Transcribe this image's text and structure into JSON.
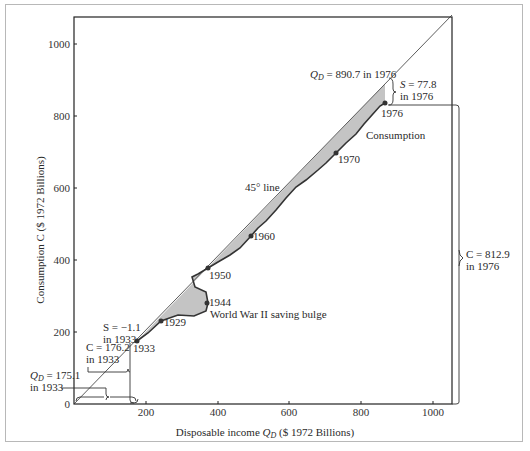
{
  "chart_data": {
    "type": "line",
    "title": "",
    "xlabel": "Disposable income Q_D ($ 1972 Billions)",
    "ylabel": "Consumption C ($ 1972 Billions)",
    "xlim": [
      0,
      1050
    ],
    "ylim": [
      0,
      1080
    ],
    "x_ticks": [
      "200",
      "400",
      "600",
      "800",
      "1000"
    ],
    "y_ticks": [
      "0",
      "200",
      "400",
      "600",
      "800",
      "1000"
    ],
    "grid": false,
    "series": [
      {
        "name": "45° line",
        "points": [
          [
            0,
            0
          ],
          [
            1060,
            1060
          ]
        ]
      },
      {
        "name": "Consumption",
        "points": [
          [
            175.1,
            176.2
          ],
          [
            200,
            190
          ],
          [
            248,
            228
          ],
          [
            290,
            250
          ],
          [
            340,
            270
          ],
          [
            370,
            274
          ],
          [
            385,
            278
          ],
          [
            385,
            320
          ],
          [
            380,
            335
          ],
          [
            360,
            355
          ],
          [
            345,
            362
          ],
          [
            350,
            380
          ],
          [
            372,
            385
          ],
          [
            400,
            400
          ],
          [
            430,
            420
          ],
          [
            460,
            440
          ],
          [
            490,
            460
          ],
          [
            520,
            480
          ],
          [
            550,
            510
          ],
          [
            580,
            530
          ],
          [
            610,
            550
          ],
          [
            640,
            570
          ],
          [
            670,
            600
          ],
          [
            700,
            620
          ],
          [
            740,
            650
          ],
          [
            760,
            680
          ],
          [
            800,
            705
          ],
          [
            840,
            740
          ],
          [
            870,
            790
          ],
          [
            890.7,
            812.9
          ]
        ]
      }
    ],
    "labeled_years": [
      {
        "year": "1929",
        "x": 248,
        "y": 228
      },
      {
        "year": "1933",
        "x": 175.1,
        "y": 176.2
      },
      {
        "year": "1944",
        "x": 370,
        "y": 280
      },
      {
        "year": "1950",
        "x": 373,
        "y": 380
      },
      {
        "year": "1960",
        "x": 494,
        "y": 466
      },
      {
        "year": "1970",
        "x": 730,
        "y": 696
      },
      {
        "year": "1976",
        "x": 890.7,
        "y": 812.9
      }
    ],
    "annotations": [
      "Q_D = 890.7 in 1976",
      "S = 77.8 in 1976",
      "C = 812.9 in 1976",
      "S = −1.1 in 1933",
      "C = 176.2 in 1933",
      "Q_D = 175.1 in 1933",
      "45° line",
      "Consumption",
      "World War II saving bulge"
    ]
  },
  "axes": {
    "x_label_main": "Disposable income ",
    "x_label_var": "Q",
    "x_label_sub": "D",
    "x_label_unit": " ($ 1972 Billions)",
    "y_label": "Consumption C ($ 1972 Billions)",
    "x_ticks": [
      "200",
      "400",
      "600",
      "800",
      "1000"
    ],
    "y_ticks": [
      "0",
      "200",
      "400",
      "600",
      "800",
      "1000"
    ]
  },
  "labels": {
    "line45": "45° line",
    "consumption": "Consumption",
    "wwii": "World War II saving bulge",
    "y1929": "1929",
    "y1933": "1933",
    "y1944": "1944",
    "y1950": "1950",
    "y1960": "1960",
    "y1970": "1970",
    "y1976": "1976",
    "qd1976_var": "Q",
    "qd1976_sub": "D",
    "qd1976_rest": " = 890.7 in 1976",
    "s1976_line1": "S = 77.8",
    "s1976_line2": "in 1976",
    "c1976_line1": "C = 812.9",
    "c1976_line2": "in 1976",
    "s1933_line1": "S = −1.1",
    "s1933_line2": "in 1933",
    "c1933_line1": "C = 176.2",
    "c1933_line2": "in 1933",
    "qd1933_var": "Q",
    "qd1933_sub": "D",
    "qd1933_rest": " = 175.1",
    "qd1933_line2": "in 1933"
  },
  "colors": {
    "fill": "#c4c4c4",
    "line": "#333333",
    "frame": "#b8b8b8"
  }
}
